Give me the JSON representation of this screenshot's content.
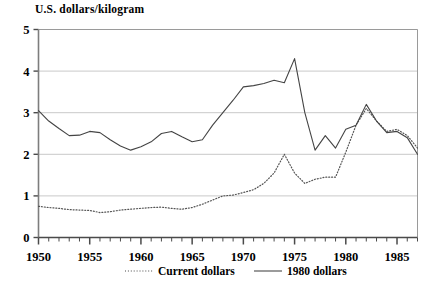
{
  "chart_data": {
    "type": "line",
    "title": "U.S. dollars/kilogram",
    "ylabel": "U.S. dollars/kilogram",
    "xlabel": "",
    "ylim": [
      0,
      5
    ],
    "xlim": [
      1950,
      1987
    ],
    "grid": true,
    "legend_position": "bottom",
    "ytick_labels": [
      "0",
      "1",
      "2",
      "3",
      "4",
      "5"
    ],
    "ytick_values": [
      0,
      1,
      2,
      3,
      4,
      5
    ],
    "xtick_labels": [
      "1950",
      "1955",
      "1960",
      "1965",
      "1970",
      "1975",
      "1980",
      "1985"
    ],
    "xtick_values": [
      1950,
      1955,
      1960,
      1965,
      1970,
      1975,
      1980,
      1985
    ],
    "minor_xtick_interval": 1,
    "x": [
      1950,
      1951,
      1952,
      1953,
      1954,
      1955,
      1956,
      1957,
      1958,
      1959,
      1960,
      1961,
      1962,
      1963,
      1964,
      1965,
      1966,
      1967,
      1968,
      1969,
      1970,
      1971,
      1972,
      1973,
      1974,
      1975,
      1976,
      1977,
      1978,
      1979,
      1980,
      1981,
      1982,
      1983,
      1984,
      1985,
      1986,
      1987
    ],
    "series": [
      {
        "name": "Current dollars",
        "style": "dotted",
        "color": "#555555",
        "values": [
          0.75,
          0.72,
          0.7,
          0.67,
          0.66,
          0.65,
          0.6,
          0.62,
          0.66,
          0.68,
          0.7,
          0.72,
          0.73,
          0.7,
          0.68,
          0.72,
          0.8,
          0.9,
          1.0,
          1.02,
          1.08,
          1.15,
          1.3,
          1.55,
          2.0,
          1.55,
          1.3,
          1.4,
          1.45,
          1.45,
          2.05,
          2.7,
          3.1,
          2.8,
          2.55,
          2.6,
          2.45,
          2.15
        ]
      },
      {
        "name": "1980 dollars",
        "style": "solid",
        "color": "#444444",
        "values": [
          3.05,
          2.8,
          2.62,
          2.45,
          2.46,
          2.55,
          2.52,
          2.35,
          2.2,
          2.1,
          2.18,
          2.3,
          2.5,
          2.55,
          2.42,
          2.3,
          2.35,
          2.7,
          3.0,
          3.3,
          3.62,
          3.65,
          3.7,
          3.78,
          3.72,
          4.3,
          3.0,
          2.1,
          2.45,
          2.15,
          2.6,
          2.7,
          3.2,
          2.8,
          2.52,
          2.55,
          2.4,
          2.0
        ]
      }
    ]
  },
  "legend": {
    "items": [
      {
        "label": "Current dollars",
        "style": "dotted"
      },
      {
        "label": "1980 dollars",
        "style": "solid"
      }
    ]
  }
}
